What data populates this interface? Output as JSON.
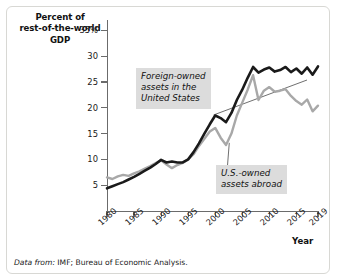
{
  "chart_data": {
    "type": "line",
    "title": "",
    "subtitle": "",
    "xlabel": "Year",
    "ylabel": "Percent of rest-of-the-world GDP",
    "ylabel_lines": [
      "Percent of",
      "rest-of-the-world",
      "GDP"
    ],
    "grid": false,
    "legend_position": "inline-annotations",
    "xlim": [
      1980,
      2019
    ],
    "ylim": [
      0,
      37
    ],
    "ytick_labels": [
      "35%",
      "30",
      "25",
      "20",
      "15",
      "10",
      "5"
    ],
    "ytick_values": [
      35,
      30,
      25,
      20,
      15,
      10,
      5
    ],
    "xtick_labels": [
      "1980",
      "1985",
      "1990",
      "1995",
      "2000",
      "2005",
      "2010",
      "2015",
      "2019"
    ],
    "xtick_values": [
      1980,
      1985,
      1990,
      1995,
      2000,
      2005,
      2010,
      2015,
      2019
    ],
    "x": [
      1980,
      1981,
      1982,
      1983,
      1984,
      1985,
      1986,
      1987,
      1988,
      1989,
      1990,
      1991,
      1992,
      1993,
      1994,
      1995,
      1996,
      1997,
      1998,
      1999,
      2000,
      2001,
      2002,
      2003,
      2004,
      2005,
      2006,
      2007,
      2008,
      2009,
      2010,
      2011,
      2012,
      2013,
      2014,
      2015,
      2016,
      2017,
      2018,
      2019
    ],
    "series": [
      {
        "name": "Foreign-owned assets in the United States",
        "color": "#1a1a1a",
        "values": [
          4.4,
          4.8,
          5.2,
          5.6,
          6.1,
          6.6,
          7.2,
          7.8,
          8.4,
          9.1,
          9.9,
          9.4,
          9.6,
          9.4,
          9.4,
          10.0,
          11.4,
          13.1,
          15.0,
          16.8,
          18.5,
          18.0,
          17.2,
          19.0,
          21.5,
          23.5,
          25.8,
          27.9,
          26.8,
          27.4,
          27.8,
          27.0,
          27.3,
          27.9,
          26.9,
          27.6,
          26.6,
          27.8,
          26.4,
          28.0
        ]
      },
      {
        "name": "U.S.-owned assets abroad",
        "color": "#a8a8a8",
        "values": [
          6.5,
          6.2,
          6.7,
          7.0,
          6.8,
          7.3,
          7.7,
          8.2,
          8.7,
          9.3,
          9.8,
          9.0,
          8.3,
          8.9,
          9.3,
          10.0,
          11.0,
          12.6,
          14.0,
          15.4,
          16.1,
          14.2,
          12.8,
          15.0,
          18.5,
          21.0,
          23.5,
          26.3,
          21.5,
          23.3,
          24.0,
          23.1,
          23.3,
          23.6,
          22.3,
          21.3,
          20.6,
          21.6,
          19.3,
          20.4
        ]
      }
    ],
    "annotations": [
      {
        "name": "foreign-owned-label",
        "text": "Foreign-owned\nassets in the\nUnited States",
        "leader_from": [
          1999.7,
          18.6
        ]
      },
      {
        "name": "us-owned-label",
        "text": "U.S.-owned\nassets abroad",
        "leader_from": [
          2002.6,
          13.2
        ]
      }
    ],
    "source_note": {
      "lead": "Data from:",
      "text": " IMF; Bureau of Economic Analysis."
    }
  },
  "colors": {
    "foreign_line": "#1a1a1a",
    "us_line": "#a8a8a8",
    "axis": "#6b6b6b",
    "annotation_bg": "#dcdcdc",
    "frame": "#d8d8d4",
    "background": "#ffffff",
    "text": "#1a1a1a"
  }
}
